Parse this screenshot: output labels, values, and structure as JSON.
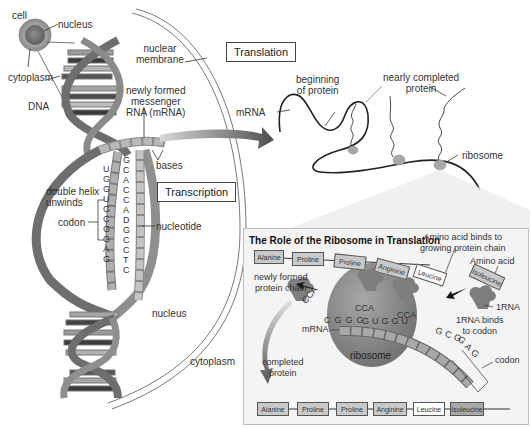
{
  "labels": {
    "cell": "cell",
    "nucleus_top": "nucleus",
    "cytoplasm_top": "cytoplasm",
    "dna": "DNA",
    "nuclear_membrane_1": "nuclear",
    "nuclear_membrane_2": "membrane",
    "mrna_formed_1": "newly formed",
    "mrna_formed_2": "messenger",
    "mrna_formed_3": "RNA (mRNA)",
    "bases": "bases",
    "double_helix_1": "double helix",
    "double_helix_2": "unwinds",
    "codon_left": "codon",
    "nucleotide": "nucleotide",
    "nucleus_bottom": "nucleus",
    "cytoplasm_bottom": "cytoplasm",
    "mrna_top": "mRNA",
    "beginning_1": "beginning",
    "beginning_2": "of protein",
    "nearly_1": "nearly completed",
    "nearly_2": "protein",
    "ribosome_top": "ribosome"
  },
  "boxes": {
    "transcription": "Transcription",
    "translation": "Translation"
  },
  "strand_left": [
    "U",
    "G",
    "G",
    "U",
    "G",
    "C",
    "G",
    "G",
    "A",
    "G"
  ],
  "strand_right": [
    "G",
    "C",
    "A",
    "C",
    "C",
    "A",
    "D",
    "G",
    "C",
    "C",
    "T",
    "C"
  ],
  "panel": {
    "title": "The Role of the Ribosome in Translation",
    "amino_binds_1": "Amino acid binds to",
    "amino_binds_2": "growing protein chain",
    "amino_acid": "Amino acid",
    "newly_formed_1": "newly formed",
    "newly_formed_2": "protein chain",
    "trna": "1RNA",
    "trna_binds_1": "1RNA binds",
    "trna_binds_2": "to codon",
    "mrna": "mRNA",
    "ribosome": "ribosome",
    "codon": "codon",
    "completed_1": "completed",
    "completed_2": "protein",
    "chain_top": [
      "Alanine",
      "Proline",
      "Proline",
      "Anginine",
      "Leucine"
    ],
    "incoming": "Isoleucine",
    "chain_bottom": [
      "Alanine",
      "Proline",
      "Proline",
      "Anginine",
      "Leucine",
      "Isoleucine"
    ],
    "mrna_bases": [
      "C",
      "G",
      "G",
      "G",
      "G",
      "U",
      "G",
      "G",
      "U",
      "G",
      "C",
      "G",
      "G",
      "A",
      "G"
    ],
    "anticodon1": "CCA",
    "anticodon2": "CCA",
    "anticodon3": "CCA",
    "anticodon_left": "CCA"
  },
  "colors": {
    "strand_dark": "#6e6e6e",
    "strand_mid": "#8f8f8f",
    "ribosome": "#8a8a8a",
    "panel_bg": "#f4f4f4",
    "arrow": "#5a5a5a"
  }
}
